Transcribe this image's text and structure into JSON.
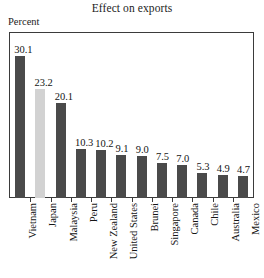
{
  "chart_data": {
    "type": "bar",
    "title": "Effect on exports",
    "xlabel": "",
    "ylabel": "Percent",
    "ylim": [
      0,
      35
    ],
    "grid": false,
    "legend": "none",
    "orientation": "vertical",
    "value_labels_shown": true,
    "categories": [
      "Vietnam",
      "Japan",
      "Malaysia",
      "Peru",
      "New Zealand",
      "United States",
      "Brunei",
      "Singapore",
      "Canada",
      "Chile",
      "Australia",
      "Mexico"
    ],
    "values": [
      30.1,
      23.2,
      20.1,
      10.3,
      10.2,
      9.1,
      9.0,
      7.5,
      7.0,
      5.3,
      4.9,
      4.7
    ],
    "value_text": [
      "30.1",
      "23.2",
      "20.1",
      "10.3",
      "10.2",
      "9.1",
      "9.0",
      "7.5",
      "7.0",
      "5.3",
      "4.9",
      "4.7"
    ],
    "bar_colors": [
      "#4a4a4a",
      "#d2d2d2",
      "#4a4a4a",
      "#4a4a4a",
      "#4a4a4a",
      "#4a4a4a",
      "#4a4a4a",
      "#4a4a4a",
      "#4a4a4a",
      "#4a4a4a",
      "#4a4a4a",
      "#4a4a4a"
    ],
    "highlighted_category": "Japan",
    "colors": {
      "bar_default": "#4a4a4a",
      "bar_highlight": "#d2d2d2",
      "frame": "#3b3b3b",
      "text": "#151515",
      "background": "#ffffff"
    }
  }
}
